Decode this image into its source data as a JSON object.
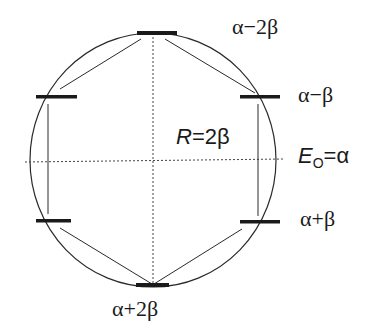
{
  "diagram": {
    "type": "frost-circle",
    "colors": {
      "line": "#2a2a2a",
      "level_bar": "#1a1a1a",
      "dotted": "#444444",
      "text": "#1a1a1a"
    },
    "radius_label": {
      "var": "R",
      "rest": "=2β"
    },
    "reference_label": {
      "var": "E",
      "subscript": "O",
      "rest": "=α"
    },
    "energy_levels": [
      {
        "id": "top",
        "label": "α−2β"
      },
      {
        "id": "upper-left",
        "label": ""
      },
      {
        "id": "upper-right",
        "label": "α−β"
      },
      {
        "id": "lower-left",
        "label": ""
      },
      {
        "id": "lower-right",
        "label": "α+β"
      },
      {
        "id": "bottom",
        "label": "α+2β"
      }
    ]
  }
}
